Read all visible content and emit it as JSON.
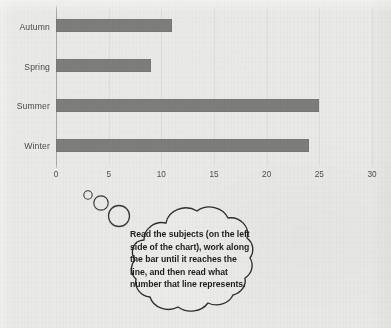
{
  "chart_data": {
    "type": "bar",
    "orientation": "horizontal",
    "title": "",
    "subtitle": "",
    "xlabel": "",
    "ylabel": "",
    "categories": [
      "Autumn",
      "Spring",
      "Summer",
      "Winter"
    ],
    "values": [
      11,
      9,
      25,
      24
    ],
    "series": [
      {
        "name": "Seasons",
        "values": [
          11,
          9,
          25,
          24
        ]
      }
    ],
    "xlim": [
      0,
      30
    ],
    "xticks": [
      0,
      5,
      10,
      15,
      20,
      25,
      30
    ],
    "xtick_labels": [
      "0",
      "5",
      "10",
      "15",
      "20",
      "25",
      "30"
    ],
    "grid": true,
    "grid_axis": "x",
    "legend": false,
    "legend_position": "none",
    "bar_color": "#7d7d7b",
    "background_color": "#e9e9e7",
    "axis_color": "#4d4d4b"
  },
  "annotation": {
    "bubble_text": "Read the subjects (on the left side of the chart), work along the bar until it reaches the line, and then read what number that line represents.",
    "bubble_lines": [
      "Read the subjects (on the left",
      "side of the chart), work along",
      "the bar until it reaches the",
      "line, and then read what",
      "number that line represents."
    ],
    "bubble_type": "thought-bubble",
    "tail_bubble_count": 3
  },
  "marginalia": {
    "ghost_text_right": "",
    "ghost_text_far_right": ""
  }
}
